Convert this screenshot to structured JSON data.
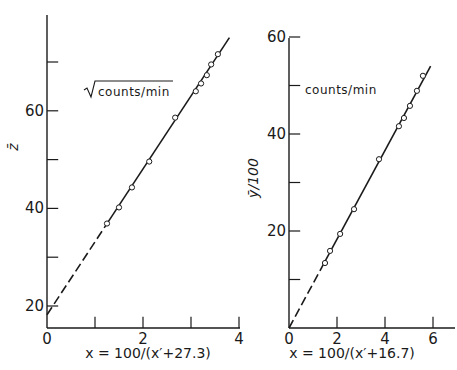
{
  "chart_data": [
    {
      "type": "scatter",
      "title": "",
      "annotation": "√counts/min",
      "annotation_text": "counts/min",
      "annotation_has_sqrt": true,
      "xlabel": "x = 100/(x′+27.3)",
      "ylabel": "z̄",
      "xlim": [
        0,
        4
      ],
      "ylim": [
        15,
        80
      ],
      "x_ticks": [
        0,
        1,
        2,
        3,
        4
      ],
      "x_tick_labels": [
        "0",
        "",
        "2",
        "",
        "4"
      ],
      "y_ticks": [
        20,
        30,
        40,
        50,
        60,
        70,
        80
      ],
      "y_tick_labels": [
        "20",
        "",
        "40",
        "",
        "60",
        "",
        "80"
      ],
      "grid": false,
      "marker": "open-circle",
      "points": {
        "x": [
          1.25,
          1.5,
          1.77,
          2.13,
          2.67,
          3.1,
          3.21,
          3.33,
          3.42,
          3.56
        ],
        "y": [
          36.9,
          40.2,
          44.3,
          49.6,
          58.6,
          64.0,
          65.6,
          67.3,
          69.5,
          71.6
        ]
      },
      "fit_line": {
        "x": [
          0,
          3.8
        ],
        "y": [
          18.2,
          75.0
        ],
        "dashed_until_x": 1.25
      }
    },
    {
      "type": "scatter",
      "title": "",
      "annotation": "counts/min",
      "annotation_text": "counts/min",
      "annotation_has_sqrt": false,
      "xlabel": "x = 100/(x′+16.7)",
      "ylabel": "ȳ/100",
      "xlim": [
        0,
        7
      ],
      "ylim": [
        0,
        60
      ],
      "x_ticks": [
        0,
        2,
        4,
        6
      ],
      "x_tick_labels": [
        "0",
        "2",
        "4",
        "6"
      ],
      "y_ticks": [
        0,
        10,
        20,
        30,
        40,
        50,
        60
      ],
      "y_tick_labels": [
        "",
        "",
        "20",
        "",
        "40",
        "",
        "60"
      ],
      "grid": false,
      "marker": "open-circle",
      "points": {
        "x": [
          1.5,
          1.71,
          2.13,
          2.71,
          3.75,
          4.58,
          4.79,
          5.04,
          5.33,
          5.58
        ],
        "y": [
          13.4,
          15.9,
          19.4,
          24.5,
          34.8,
          41.6,
          43.3,
          45.8,
          48.9,
          52.0
        ]
      },
      "fit_line": {
        "x": [
          0,
          5.9
        ],
        "y": [
          0,
          54.0
        ],
        "dashed_until_x": 1.5
      }
    }
  ],
  "colors": {
    "ink": "#1a1a1a",
    "background": "#ffffff"
  }
}
